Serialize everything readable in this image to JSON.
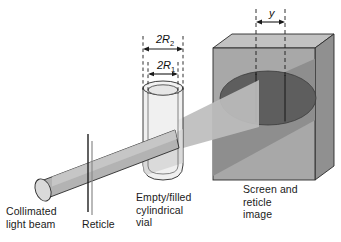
{
  "figure": {
    "background_color": "#ffffff"
  },
  "labels": {
    "collimated_light_beam": "Collimated\nlight beam",
    "reticle": "Reticle",
    "vial": "Empty/filled\ncylindrical\nvial",
    "screen": "Screen and\nreticle\nimage"
  },
  "dimensions": {
    "outer_diameter": "2R",
    "outer_diameter_sub": "2",
    "inner_diameter": "2R",
    "inner_diameter_sub": "1",
    "reticle_image_separation": "y"
  },
  "colors": {
    "beam_fill": "#b3b3b3",
    "beam_fill_light": "#c6c6c6",
    "beam_endcap": "#d6d6d6",
    "beam_spread": "#bdbdbd",
    "screen_face": "#a8a8a8",
    "screen_top": "#c2c2c2",
    "screen_side": "#909090",
    "screen_shadow": "#8e8e8e",
    "spot_ellipse": "#5e5e5e",
    "vial_glass": "#ededed",
    "vial_glass_lit": "#e2e2e2",
    "outline": "#1a1a1a",
    "text": "#1a1a1a"
  }
}
